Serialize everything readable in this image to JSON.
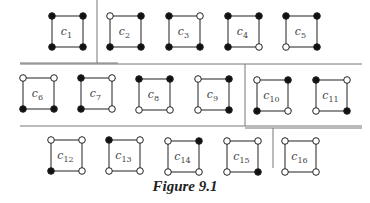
{
  "figure": {
    "caption": "Figure 9.1",
    "colors": {
      "line": "#555555",
      "dot_filled": "#111111",
      "dot_open": "#ffffff",
      "label": "#444444"
    },
    "separators": {
      "horizontal": [
        {
          "x1": 20,
          "x2": 118,
          "y": 63
        },
        {
          "x1": 20,
          "x2": 362,
          "y": 64
        },
        {
          "x1": 20,
          "x2": 362,
          "y": 126
        },
        {
          "x1": 245,
          "x2": 362,
          "y": 128
        }
      ],
      "vertical": [
        {
          "x": 97,
          "y1": 0,
          "y2": 63
        },
        {
          "x": 245,
          "y1": 64,
          "y2": 126
        },
        {
          "x": 273,
          "y1": 128,
          "y2": 168
        }
      ]
    },
    "squares": [
      {
        "id": "C1",
        "sub": "1",
        "x": 52,
        "y": 16,
        "corners": {
          "tl": true,
          "tr": true,
          "bl": true,
          "br": true
        }
      },
      {
        "id": "C2",
        "sub": "2",
        "x": 110,
        "y": 16,
        "corners": {
          "tl": false,
          "tr": true,
          "bl": true,
          "br": true
        }
      },
      {
        "id": "C3",
        "sub": "3",
        "x": 169,
        "y": 16,
        "corners": {
          "tl": true,
          "tr": false,
          "bl": true,
          "br": true
        }
      },
      {
        "id": "C4",
        "sub": "4",
        "x": 228,
        "y": 16,
        "corners": {
          "tl": true,
          "tr": true,
          "bl": true,
          "br": false
        }
      },
      {
        "id": "C5",
        "sub": "5",
        "x": 286,
        "y": 16,
        "corners": {
          "tl": true,
          "tr": true,
          "bl": false,
          "br": true
        }
      },
      {
        "id": "C6",
        "sub": "6",
        "x": 23,
        "y": 78,
        "corners": {
          "tl": false,
          "tr": false,
          "bl": true,
          "br": true
        }
      },
      {
        "id": "C7",
        "sub": "7",
        "x": 81,
        "y": 78,
        "corners": {
          "tl": true,
          "tr": false,
          "bl": true,
          "br": false
        }
      },
      {
        "id": "C8",
        "sub": "8",
        "x": 139,
        "y": 79,
        "corners": {
          "tl": true,
          "tr": true,
          "bl": false,
          "br": false
        }
      },
      {
        "id": "C9",
        "sub": "9",
        "x": 198,
        "y": 79,
        "corners": {
          "tl": false,
          "tr": true,
          "bl": false,
          "br": true
        }
      },
      {
        "id": "C10",
        "sub": "10",
        "x": 257,
        "y": 80,
        "corners": {
          "tl": false,
          "tr": true,
          "bl": true,
          "br": false
        }
      },
      {
        "id": "C11",
        "sub": "11",
        "x": 316,
        "y": 80,
        "corners": {
          "tl": true,
          "tr": false,
          "bl": false,
          "br": true
        }
      },
      {
        "id": "C12",
        "sub": "12",
        "x": 51,
        "y": 140,
        "corners": {
          "tl": false,
          "tr": false,
          "bl": true,
          "br": false
        }
      },
      {
        "id": "C13",
        "sub": "13",
        "x": 109,
        "y": 140,
        "corners": {
          "tl": true,
          "tr": false,
          "bl": false,
          "br": false
        }
      },
      {
        "id": "C14",
        "sub": "14",
        "x": 168,
        "y": 141,
        "corners": {
          "tl": false,
          "tr": true,
          "bl": false,
          "br": false
        }
      },
      {
        "id": "C15",
        "sub": "15",
        "x": 227,
        "y": 141,
        "corners": {
          "tl": false,
          "tr": false,
          "bl": false,
          "br": true
        }
      },
      {
        "id": "C16",
        "sub": "16",
        "x": 285,
        "y": 141,
        "corners": {
          "tl": false,
          "tr": false,
          "bl": false,
          "br": false
        }
      }
    ],
    "square_size": 31
  }
}
